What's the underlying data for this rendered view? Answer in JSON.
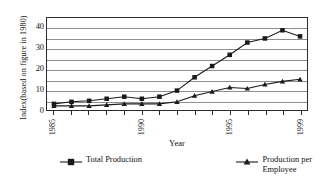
{
  "chart_data": {
    "type": "line",
    "title": "",
    "xlabel": "Year",
    "ylabel": "Index(based on figure in 1980)",
    "x": [
      1985,
      1986,
      1987,
      1988,
      1989,
      1990,
      1991,
      1992,
      1993,
      1994,
      1995,
      1996,
      1997,
      1998,
      1999
    ],
    "xtick_labels": [
      "1985",
      "1990",
      "1995",
      "1999"
    ],
    "xtick_years": [
      1985,
      1990,
      1995,
      1999
    ],
    "ylim": [
      0,
      45
    ],
    "ytick_labels": [
      "0",
      "10",
      "20",
      "30",
      "40"
    ],
    "ytick_values": [
      0,
      10,
      20,
      30,
      40
    ],
    "gridline_values": [
      5,
      10,
      15,
      20,
      25,
      30,
      35,
      40
    ],
    "grid": true,
    "legend_position": "bottom",
    "series": [
      {
        "name": "Total Production",
        "marker": "square",
        "values": [
          3,
          4,
          4.5,
          5.5,
          6.5,
          5.5,
          6.5,
          9.5,
          16,
          21.5,
          27,
          33,
          35,
          39,
          36
        ]
      },
      {
        "name": "Production per Employee",
        "marker": "triangle",
        "values": [
          2,
          2,
          2,
          2.5,
          3,
          3,
          3,
          4,
          7,
          9,
          11,
          10.5,
          12.5,
          14,
          15
        ]
      }
    ]
  },
  "legend": {
    "items": [
      {
        "label": "Total Production",
        "marker": "square"
      },
      {
        "label": "Production per\nEmployee",
        "marker": "triangle"
      }
    ]
  },
  "colors": {
    "line": "#1a1a1a",
    "grid": "#8d8d8d",
    "axis": "#2b2b2b",
    "background": "#ffffff"
  }
}
